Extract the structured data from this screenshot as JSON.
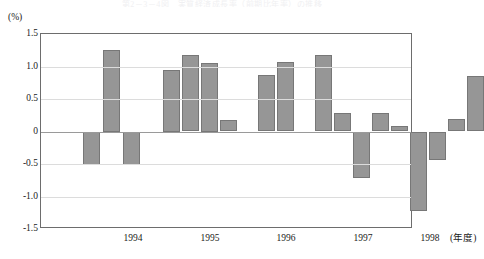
{
  "top_title_sliver": "第2－3－4図　実質経済成長率（前期比年率）の推移",
  "axes": {
    "y_unit_label": "(%)",
    "y_ticks": [
      "1.5",
      "1.0",
      "0.5",
      "0",
      "-0.5",
      "-1.0",
      "-1.5"
    ],
    "x_ticks": [
      "1994",
      "1995",
      "1996",
      "1997",
      "1998"
    ],
    "x_unit_label": "(年度)"
  },
  "colors": {
    "bar_fill": "#969696",
    "bar_stroke": "#777777",
    "frame": "#6d6d6d",
    "gridline": "#dcdcdc",
    "zeroline": "#9a9a9a",
    "background": "#ffffff",
    "text": "#1a1a1a"
  },
  "chart_data": {
    "type": "bar",
    "title": "",
    "subtitle": "",
    "xlabel": "(年度)",
    "ylabel": "(%)",
    "ylim": [
      -1.5,
      1.5
    ],
    "ytick_values": [
      1.5,
      1.0,
      0.5,
      0,
      -0.5,
      -1.0,
      -1.5
    ],
    "grid": true,
    "legend": "none",
    "categories": [
      "1994",
      "1995",
      "1996",
      "1997",
      "1998"
    ],
    "category_tick_x": [
      93,
      170,
      246,
      323,
      390
    ],
    "bars": [
      {
        "index": 0,
        "x": 42,
        "width": 17,
        "value": -0.52
      },
      {
        "index": 1,
        "x": 62,
        "width": 17,
        "value": 1.25
      },
      {
        "index": 2,
        "x": 82,
        "width": 17,
        "value": -0.52
      },
      {
        "index": 3,
        "x": 102,
        "width": 17,
        "value": 0.0
      },
      {
        "index": 4,
        "x": 122,
        "width": 17,
        "value": 0.95
      },
      {
        "index": 5,
        "x": 141,
        "width": 17,
        "value": 1.17
      },
      {
        "index": 6,
        "x": 160,
        "width": 17,
        "value": 1.05
      },
      {
        "index": 7,
        "x": 179,
        "width": 17,
        "value": 0.18
      },
      {
        "index": 8,
        "x": 198,
        "width": 17,
        "value": 0.0
      },
      {
        "index": 9,
        "x": 217,
        "width": 17,
        "value": 0.87
      },
      {
        "index": 10,
        "x": 236,
        "width": 17,
        "value": 1.07
      },
      {
        "index": 11,
        "x": 255,
        "width": 17,
        "value": 0.0
      },
      {
        "index": 12,
        "x": 274,
        "width": 17,
        "value": 1.17
      },
      {
        "index": 13,
        "x": 293,
        "width": 17,
        "value": 0.28
      },
      {
        "index": 14,
        "x": 312,
        "width": 17,
        "value": -0.72
      },
      {
        "index": 15,
        "x": 331,
        "width": 17,
        "value": 0.28
      },
      {
        "index": 16,
        "x": 350,
        "width": 17,
        "value": 0.09
      },
      {
        "index": 17,
        "x": 369,
        "width": 17,
        "value": -1.22
      },
      {
        "index": 18,
        "x": 388,
        "width": 17,
        "value": -0.44
      },
      {
        "index": 19,
        "x": 407,
        "width": 17,
        "value": 0.19
      },
      {
        "index": 20,
        "x": 426,
        "width": 17,
        "value": 0.86
      }
    ]
  }
}
